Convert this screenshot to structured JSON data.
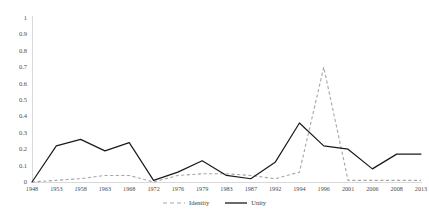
{
  "chart_data": {
    "type": "line",
    "title": "",
    "subtitle": "",
    "xlabel": "",
    "ylabel": "",
    "ylim": [
      0,
      1
    ],
    "ytick_labels": [
      "1",
      "0.9",
      "0.8",
      "0.7",
      "0.6",
      "0.5",
      "0.4",
      "0.3",
      "0.2",
      "0.1",
      "0"
    ],
    "ytick_values": [
      1,
      0.9,
      0.8,
      0.7,
      0.6,
      0.5,
      0.4,
      0.3,
      0.2,
      0.1,
      0
    ],
    "grid": false,
    "legend_position": "bottom-center",
    "categories": [
      "1948",
      "1953",
      "1958",
      "1963",
      "1968",
      "1972",
      "1976",
      "1979",
      "1983",
      "1987",
      "1992",
      "1994",
      "1996",
      "2001",
      "2006",
      "2008",
      "2013"
    ],
    "series": [
      {
        "name": "Identity",
        "color": "#a6a6a6",
        "style": "dashed",
        "values": [
          0.0,
          0.01,
          0.02,
          0.04,
          0.04,
          0.0,
          0.04,
          0.05,
          0.05,
          0.04,
          0.02,
          0.06,
          0.7,
          0.01,
          0.01,
          0.01,
          0.01
        ]
      },
      {
        "name": "Unity",
        "color": "#1a1a1a",
        "style": "solid",
        "values": [
          0.0,
          0.22,
          0.26,
          0.19,
          0.24,
          0.01,
          0.06,
          0.13,
          0.04,
          0.02,
          0.12,
          0.36,
          0.22,
          0.2,
          0.08,
          0.17,
          0.17
        ]
      }
    ]
  },
  "legend": {
    "items": [
      {
        "label": "Identity",
        "marker": "dashed-line-swatch"
      },
      {
        "label": "Unity",
        "marker": "solid-line-swatch"
      }
    ]
  },
  "colors": {
    "identity": "#a6a6a6",
    "unity": "#1a1a1a",
    "axis": "#d9d9d9",
    "tick_text": "#4d4d4d",
    "background": "#ffffff"
  }
}
